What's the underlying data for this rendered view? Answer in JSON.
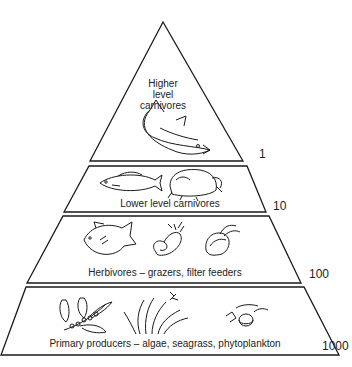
{
  "diagram": {
    "type": "trophic-pyramid",
    "tiers": [
      {
        "level": 4,
        "label_lines": [
          "Higher",
          "level",
          "carnivores"
        ],
        "value": "1",
        "illustrations": [
          "large-fish"
        ]
      },
      {
        "level": 3,
        "label": "Lower level carnivores",
        "value": "10",
        "illustrations": [
          "fish",
          "crab"
        ]
      },
      {
        "level": 2,
        "label": "Herbivores – grazers, filter feeders",
        "value": "100",
        "illustrations": [
          "triggerfish",
          "sea-slug",
          "bivalve"
        ]
      },
      {
        "level": 1,
        "label": "Primary producers – algae, seagrass, phytoplankton",
        "value": "1000",
        "illustrations": [
          "algae",
          "seagrass",
          "phytoplankton"
        ]
      }
    ],
    "colors": {
      "line": "#1a1a1a",
      "fill": "#ffffff"
    }
  }
}
